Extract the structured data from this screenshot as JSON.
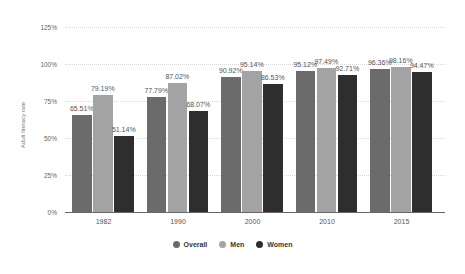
{
  "chart_data": {
    "type": "bar",
    "title": "",
    "xlabel": "",
    "ylabel": "Adult literacy rate",
    "ylim": [
      0,
      125
    ],
    "yticks": [
      "0%",
      "25%",
      "50%",
      "75%",
      "100%",
      "125%"
    ],
    "grid": true,
    "legend_position": "bottom",
    "categories": [
      "1982",
      "1990",
      "2000",
      "2010",
      "2015"
    ],
    "series": [
      {
        "name": "Overall",
        "color": "#6b6b6b",
        "values": [
          65.51,
          77.79,
          90.92,
          95.12,
          96.36
        ],
        "labels": [
          "65.51%",
          "77.79%",
          "90.92%",
          "95.12%",
          "96.36%"
        ]
      },
      {
        "name": "Men",
        "color": "#a3a3a3",
        "values": [
          79.19,
          87.02,
          95.14,
          97.49,
          98.16
        ],
        "labels": [
          "79.19%",
          "87.02%",
          "95.14%",
          "97.49%",
          "98.16%"
        ]
      },
      {
        "name": "Women",
        "color": "#2e2e2e",
        "values": [
          51.14,
          68.07,
          86.53,
          92.71,
          94.47
        ],
        "labels": [
          "51.14%",
          "68.07%",
          "86.53%",
          "92.71%",
          "94.47%"
        ]
      }
    ]
  },
  "legend": {
    "items": [
      {
        "label": "Overall",
        "color": "#6b6b6b"
      },
      {
        "label": "Men",
        "color": "#a3a3a3"
      },
      {
        "label": "Women",
        "color": "#2e2e2e"
      }
    ]
  }
}
